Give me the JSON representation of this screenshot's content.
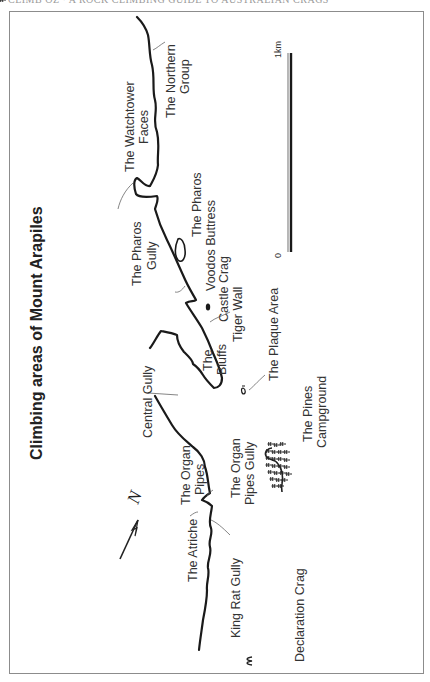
{
  "page": {
    "header": "CLIMB OZ · A ROCK CLIMBING GUIDE TO AUSTRALIAN CRAGS"
  },
  "map": {
    "title": "Climbing areas of Mount Arapiles",
    "orientation": "rotated 90° counter-clockwise",
    "north_arrow": {
      "label": "N"
    },
    "scale_bar": {
      "start_label": "0",
      "end_label": "1km"
    },
    "labels": {
      "northern_group_1": "The Northern",
      "northern_group_2": "Group",
      "watchtower_1": "The Watchtower",
      "watchtower_2": "Faces",
      "pharos_gully_1": "The Pharos",
      "pharos_gully_2": "Gully",
      "pharos": "The Pharos",
      "voodos_buttress": "Voodos Buttress",
      "castle_crag": "Castle Crag",
      "tiger_wall": "Tiger Wall",
      "plaque_area": "The Plaque Area",
      "bluffs_1": "The",
      "bluffs_2": "Bluffs",
      "central_gully": "Central Gully",
      "pines_1": "The Pines",
      "pines_2": "Campground",
      "organ_pipes_1": "The Organ",
      "organ_pipes_2": "Pipes",
      "organ_pipes_gully_1": "The Organ",
      "organ_pipes_gully_2": "Pipes Gully",
      "atriche": "The Atriche",
      "king_rat_gully": "King Rat Gully",
      "declaration_crag": "Declaration Crag"
    },
    "colors": {
      "ridge": "#1a1a1a",
      "text": "#333333",
      "frame": "#8c8c8c"
    }
  }
}
